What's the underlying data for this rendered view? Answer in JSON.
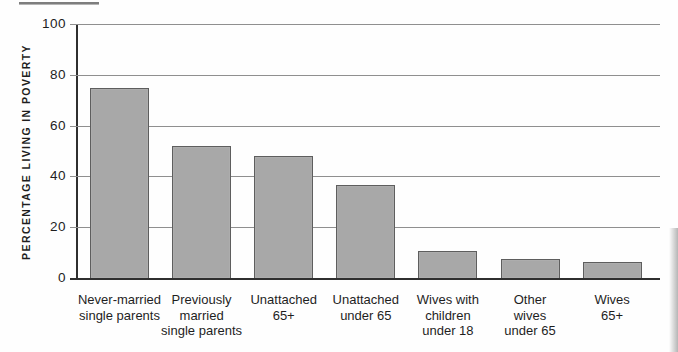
{
  "chart_data": {
    "type": "bar",
    "title": "",
    "xlabel": "",
    "ylabel": "PERCENTAGE LIVING IN POVERTY",
    "categories": [
      "Never-married single parents",
      "Previously married single parents",
      "Unattached 65+",
      "Unattached under 65",
      "Wives with children under 18",
      "Other wives under 65",
      "Wives 65+"
    ],
    "category_lines": [
      [
        "Never-married",
        "single parents"
      ],
      [
        "Previously",
        "married",
        "single parents"
      ],
      [
        "Unattached",
        "65+"
      ],
      [
        "Unattached",
        "under 65"
      ],
      [
        "Wives with",
        "children",
        "under 18"
      ],
      [
        "Other",
        "wives",
        "under 65"
      ],
      [
        "Wives",
        "65+"
      ]
    ],
    "values": [
      75,
      52,
      48,
      36.5,
      10.5,
      7.5,
      6.5
    ],
    "ylim": [
      0,
      100
    ],
    "yticks": [
      0,
      20,
      40,
      60,
      80,
      100
    ],
    "grid": true,
    "legend_position": "none",
    "colors": {
      "bar_fill": "#a8a8a8",
      "bar_border": "#5e5e5e",
      "grid_line": "#8f8f8f",
      "axis_line": "#2f2f2f",
      "text": "#1e1e1e"
    }
  }
}
